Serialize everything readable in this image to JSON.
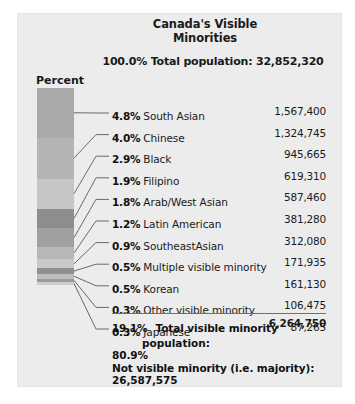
{
  "title": {
    "line1": "Canada's Visible",
    "line2": "Minorities"
  },
  "summary": {
    "percent": "100.0%",
    "text": "Total population: 32,852,320"
  },
  "axis": {
    "percent_label": "Percent"
  },
  "chart_data": {
    "type": "bar",
    "title": "Canada's Visible Minorities",
    "subtitle": "100.0% Total population: 32,852,320",
    "ylabel": "Percent",
    "xlabel": "",
    "grid": false,
    "legend": "none",
    "orientation": "vertical-stacked",
    "total_population": "32,852,320",
    "categories": [
      "South Asian",
      "Chinese",
      "Black",
      "Filipino",
      "Arab/West Asian",
      "Latin American",
      "SoutheastAsian",
      "Multiple visible minority",
      "Korean",
      "Other visible minority",
      "Japanese"
    ],
    "values": [
      4.8,
      4.0,
      2.9,
      1.9,
      1.8,
      1.2,
      0.9,
      0.5,
      0.5,
      0.3,
      0.3
    ],
    "counts": [
      1567400,
      1324745,
      945665,
      619310,
      587460,
      381280,
      312080,
      171935,
      161130,
      106475,
      87265
    ],
    "ylim": [
      0,
      100
    ],
    "rows": [
      {
        "pct": "4.8%",
        "name": "South Asian",
        "count": "1,567,400",
        "color": "#a9a9a9"
      },
      {
        "pct": "4.0%",
        "name": "Chinese",
        "count": "1,324,745",
        "color": "#b4b4b4"
      },
      {
        "pct": "2.9%",
        "name": "Black",
        "count": "945,665",
        "color": "#c6c6c6"
      },
      {
        "pct": "1.9%",
        "name": "Filipino",
        "count": "619,310",
        "color": "#8d8d8d"
      },
      {
        "pct": "1.8%",
        "name": "Arab/West Asian",
        "count": "587,460",
        "color": "#a0a0a0"
      },
      {
        "pct": "1.2%",
        "name": "Latin American",
        "count": "381,280",
        "color": "#b8b8b8"
      },
      {
        "pct": "0.9%",
        "name": "SoutheastAsian",
        "count": "312,080",
        "color": "#c9c9c9"
      },
      {
        "pct": "0.5%",
        "name": "Multiple visible minority",
        "count": "171,935",
        "color": "#8f8f8f"
      },
      {
        "pct": "0.5%",
        "name": "Korean",
        "count": "161,130",
        "color": "#bdbdbd"
      },
      {
        "pct": "0.3%",
        "name": "Other visible minority",
        "count": "106,475",
        "color": "#9a9a9a"
      },
      {
        "pct": "0.3%",
        "name": "Japanese",
        "count": "87,265",
        "color": "#cfcfcf"
      }
    ],
    "total_row": {
      "pct": "19.1%",
      "name": "Total visible minority",
      "name2": "population:",
      "count": "6,264,750"
    },
    "footnote": {
      "percent": "80.9%",
      "label": "Not visible minority (i.e. majority):",
      "count": "26,587,575"
    }
  }
}
